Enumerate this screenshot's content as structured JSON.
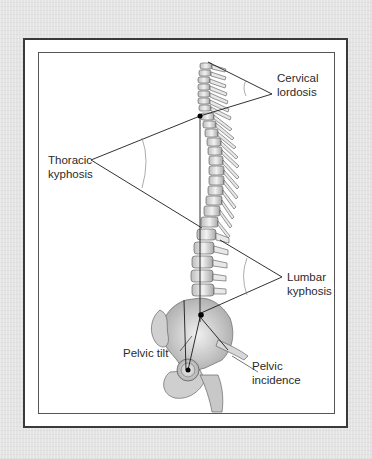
{
  "figure": {
    "background_color": "#e4e4e4",
    "frame_color": "#3a3a3a",
    "line_color": "#1a1a1a",
    "labels": {
      "cervical": {
        "line1": "Cervical",
        "line2": "lordosis"
      },
      "thoracic": {
        "line1": "Thoracic",
        "line2": "kyphosis"
      },
      "lumbar": {
        "line1": "Lumbar",
        "line2": "kyphosis"
      },
      "pelvic_tilt": {
        "line1": "Pelvic tilt"
      },
      "pelvic_incidence": {
        "line1": "Pelvic",
        "line2": "incidence"
      }
    }
  }
}
